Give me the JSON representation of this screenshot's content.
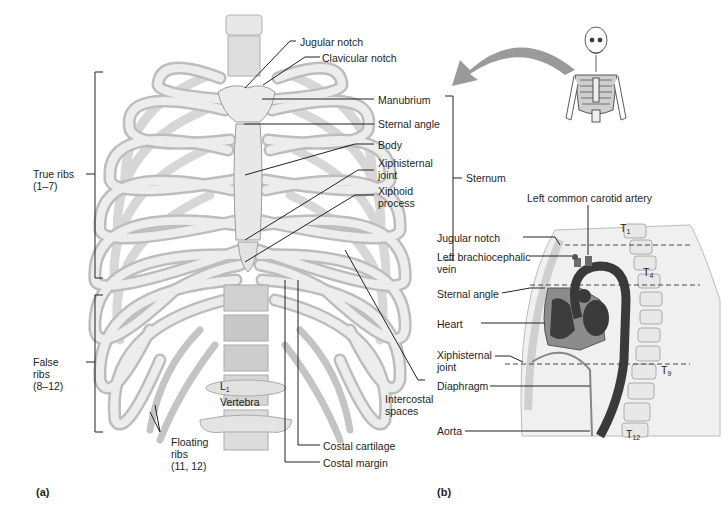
{
  "figure": {
    "panel_a": {
      "tag": "(a)",
      "labels": {
        "jugular_notch": "Jugular notch",
        "clavicular_notch": "Clavicular notch",
        "manubrium": "Manubrium",
        "sternal_angle": "Sternal angle",
        "body": "Body",
        "xiphisternal_joint_1": "Xiphisternal",
        "xiphisternal_joint_2": "joint",
        "xiphoid_process_1": "Xiphoid",
        "xiphoid_process_2": "process",
        "sternum": "Sternum",
        "true_ribs_1": "True ribs",
        "true_ribs_2": "(1–7)",
        "false_ribs_1": "False",
        "false_ribs_2": "ribs",
        "false_ribs_3": "(8–12)",
        "floating_ribs_1": "Floating",
        "floating_ribs_2": "ribs",
        "floating_ribs_3": "(11, 12)",
        "vertebra_letter": "L",
        "vertebra_sub": "1",
        "vertebra": "Vertebra",
        "intercostal_spaces_1": "Intercostal",
        "intercostal_spaces_2": "spaces",
        "costal_cartilage": "Costal cartilage",
        "costal_margin": "Costal margin"
      }
    },
    "panel_b": {
      "tag": "(b)",
      "labels": {
        "left_common_carotid_artery": "Left common carotid artery",
        "jugular_notch": "Jugular notch",
        "left_brachiocephalic_vein_1": "Left brachiocephalic",
        "left_brachiocephalic_vein_2": "vein",
        "sternal_angle": "Sternal angle",
        "heart": "Heart",
        "xiphisternal_joint_1": "Xiphisternal",
        "xiphisternal_joint_2": "joint",
        "diaphragm": "Diaphragm",
        "aorta": "Aorta",
        "t1": "T",
        "t1_sub": "1",
        "t4": "T",
        "t4_sub": "4",
        "t9": "T",
        "t9_sub": "9",
        "t12": "T",
        "t12_sub": "12"
      }
    },
    "colors": {
      "bone": "#e6e6e6",
      "bone_edge": "#a8a8a8",
      "leader": "#222222",
      "arrow": "#9a9a9a",
      "aorta": "#3a3a3a",
      "heart_bg": "#8c8c8c"
    }
  }
}
